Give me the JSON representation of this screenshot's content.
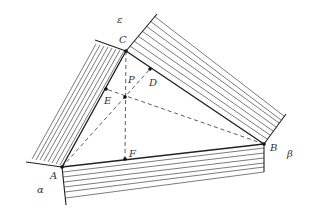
{
  "figure": {
    "colors": {
      "line": "#222222",
      "hatch": "#444444",
      "dashed": "#333333",
      "background": "#ffffff"
    }
  },
  "labels": {
    "A": "A",
    "B": "B",
    "C": "C",
    "D": "D",
    "E": "E",
    "F": "F",
    "P": "P",
    "alpha": "α",
    "beta": "β",
    "epsilon": "ε"
  },
  "points": {
    "A": [
      62,
      167
    ],
    "B": [
      264,
      144
    ],
    "C": [
      126,
      51
    ],
    "P": [
      125,
      97
    ],
    "D": [
      150,
      69
    ],
    "E": [
      106,
      89
    ],
    "F": [
      125,
      159
    ]
  },
  "segments": {
    "solid": [
      [
        "A",
        "B"
      ],
      [
        "B",
        "C"
      ],
      [
        "C",
        "A"
      ]
    ],
    "dashed": [
      [
        "C",
        "F"
      ],
      [
        "A",
        "D"
      ],
      [
        "B",
        "E"
      ]
    ]
  }
}
